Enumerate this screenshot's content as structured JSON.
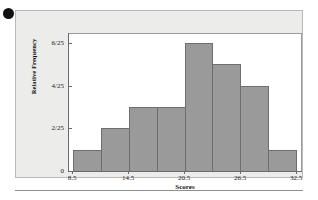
{
  "figure": {
    "bullet_marker": "filled-circle",
    "card_background": "#ececeb",
    "card_border": "#b9b9b7",
    "plot_background": "#ffffff"
  },
  "chart_data": {
    "type": "bar",
    "title": "",
    "subtitle": "",
    "xlabel": "Scores",
    "ylabel": "Relative Frequency",
    "categories": [
      "8.5-11.5",
      "11.5-14.5",
      "14.5-17.5",
      "17.5-20.5",
      "20.5-23.5",
      "23.5-26.5",
      "26.5-29.5",
      "29.5-32.5"
    ],
    "bin_edges": [
      8.5,
      11.5,
      14.5,
      17.5,
      20.5,
      23.5,
      26.5,
      29.5,
      32.5
    ],
    "bin_width": 3,
    "values": [
      0.04,
      0.08,
      0.12,
      0.12,
      0.24,
      0.2,
      0.16,
      0.04
    ],
    "frequencies": [
      1,
      2,
      3,
      3,
      6,
      5,
      4,
      1
    ],
    "value_labels": [
      "1/25",
      "2/25",
      "3/25",
      "4/25",
      "6/25",
      "5/25",
      "4/25",
      "1/25"
    ],
    "total_count": 25,
    "ylim": [
      0,
      0.24
    ],
    "xlim": [
      8.5,
      32.5
    ],
    "grid": false,
    "legend": false,
    "bar_color": "#9a9a9a",
    "bar_border_color": "#6e6e6e",
    "yticks": [
      {
        "label": "0",
        "value": 0
      },
      {
        "label": "2/25",
        "value": 0.08
      },
      {
        "label": "4/25",
        "value": 0.16
      },
      {
        "label": "6/25",
        "value": 0.24
      }
    ],
    "xticks": [
      {
        "label": "8.5",
        "value": 8.5
      },
      {
        "label": "14.5",
        "value": 14.5
      },
      {
        "label": "20.5",
        "value": 20.5
      },
      {
        "label": "26.5",
        "value": 26.5
      },
      {
        "label": "32.5",
        "value": 32.5
      }
    ]
  }
}
